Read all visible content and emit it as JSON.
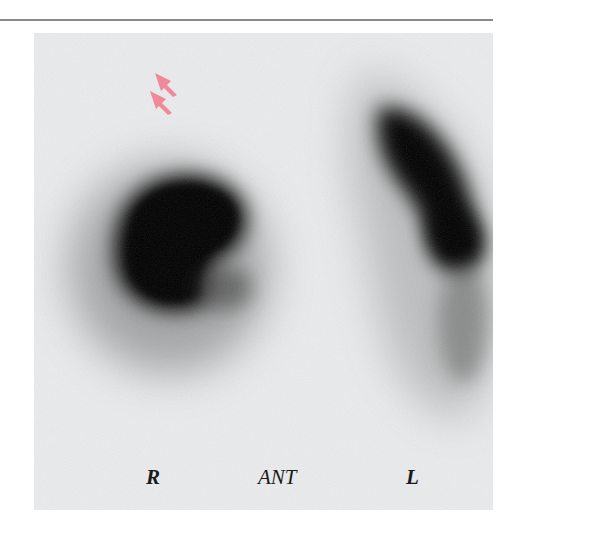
{
  "figure": {
    "type": "nuclear-medicine-scan",
    "view_label": "ANT",
    "labels": {
      "right": "R",
      "center": "ANT",
      "left": "L"
    },
    "annotations": [
      {
        "name": "arrow-1",
        "color": "#f08a9a"
      },
      {
        "name": "arrow-2",
        "color": "#f08a9a"
      }
    ],
    "colors": {
      "background": "#e9ebec",
      "uptake": "#000000",
      "arrow": "#f08a9a",
      "rule": "#8a8a8a"
    }
  }
}
